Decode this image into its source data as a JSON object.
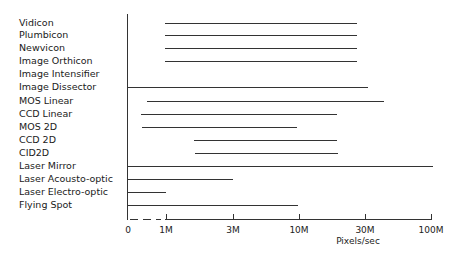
{
  "chart_data": {
    "type": "bar",
    "orientation": "horizontal-range",
    "title": "",
    "xlabel": "Pixels/sec",
    "ylabel": "",
    "x_scale": "log (with linear 0–1M segment shown dashed)",
    "x_ticks": [
      "0",
      "1M",
      "3M",
      "10M",
      "30M",
      "100M"
    ],
    "xlim": [
      0,
      100000000
    ],
    "grid": false,
    "legend": null,
    "categories": [
      "Vidicon",
      "Plumbicon",
      "Newvicon",
      "Image Orthicon",
      "Image Intensifier",
      "Image Dissector",
      "MOS Linear",
      "CCD Linear",
      "MOS 2D",
      "CCD 2D",
      "CID2D",
      "Laser Mirror",
      "Laser Acousto-optic",
      "Laser Electro-optic",
      "Flying Spot"
    ],
    "series": [
      {
        "name": "min pixels/sec",
        "values": [
          1000000,
          1000000,
          1000000,
          1000000,
          null,
          0,
          300000,
          200000,
          200000,
          2000000,
          2000000,
          0,
          0,
          0,
          0
        ]
      },
      {
        "name": "max pixels/sec",
        "values": [
          25000000,
          25000000,
          25000000,
          25000000,
          null,
          35000000,
          50000000,
          20000000,
          10000000,
          20000000,
          20000000,
          100000000,
          3000000,
          1000000,
          10000000
        ]
      }
    ]
  },
  "rows": [
    {
      "label": "Vidicon",
      "y": 23,
      "x1": 165,
      "x2": 357
    },
    {
      "label": "Plumbicon",
      "y": 35,
      "x1": 165,
      "x2": 357
    },
    {
      "label": "Newvicon",
      "y": 48,
      "x1": 165,
      "x2": 357
    },
    {
      "label": "Image Orthicon",
      "y": 61,
      "x1": 165,
      "x2": 357
    },
    {
      "label": "Image Intensifier",
      "y": 74,
      "x1": null,
      "x2": null
    },
    {
      "label": "Image Dissector",
      "y": 87,
      "x1": 127,
      "x2": 368
    },
    {
      "label": "MOS Linear",
      "y": 101,
      "x1": 147,
      "x2": 384
    },
    {
      "label": "CCD Linear",
      "y": 114,
      "x1": 141,
      "x2": 337
    },
    {
      "label": "MOS 2D",
      "y": 127,
      "x1": 142,
      "x2": 297
    },
    {
      "label": "CCD 2D",
      "y": 140,
      "x1": 194,
      "x2": 337
    },
    {
      "label": "CID2D",
      "y": 153,
      "x1": 195,
      "x2": 338
    },
    {
      "label": "Laser Mirror",
      "y": 166,
      "x1": 127,
      "x2": 433
    },
    {
      "label": "Laser Acousto-optic",
      "y": 179,
      "x1": 127,
      "x2": 233
    },
    {
      "label": "Laser Electro-optic",
      "y": 192,
      "x1": 127,
      "x2": 166
    },
    {
      "label": "Flying Spot",
      "y": 205,
      "x1": 127,
      "x2": 298
    }
  ],
  "axis": {
    "ticks": [
      {
        "label": "0",
        "x": 128
      },
      {
        "label": "1M",
        "x": 166
      },
      {
        "label": "3M",
        "x": 233
      },
      {
        "label": "10M",
        "x": 299
      },
      {
        "label": "30M",
        "x": 365
      },
      {
        "label": "100M",
        "x": 431
      }
    ],
    "title": "Pixels/sec"
  }
}
